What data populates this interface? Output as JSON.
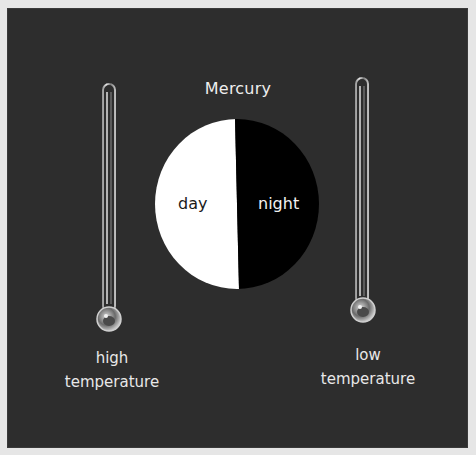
{
  "diagram": {
    "title": "Mercury",
    "planet": {
      "day_label": "day",
      "night_label": "night",
      "day_color": "#ffffff",
      "night_color": "#000000"
    },
    "left_thermometer": {
      "line1": "high",
      "line2": "temperature"
    },
    "right_thermometer": {
      "line1": "low",
      "line2": "temperature"
    },
    "colors": {
      "background": "#2d2d2d",
      "frame": "#e6e6e6",
      "text": "#eeeeee"
    }
  }
}
